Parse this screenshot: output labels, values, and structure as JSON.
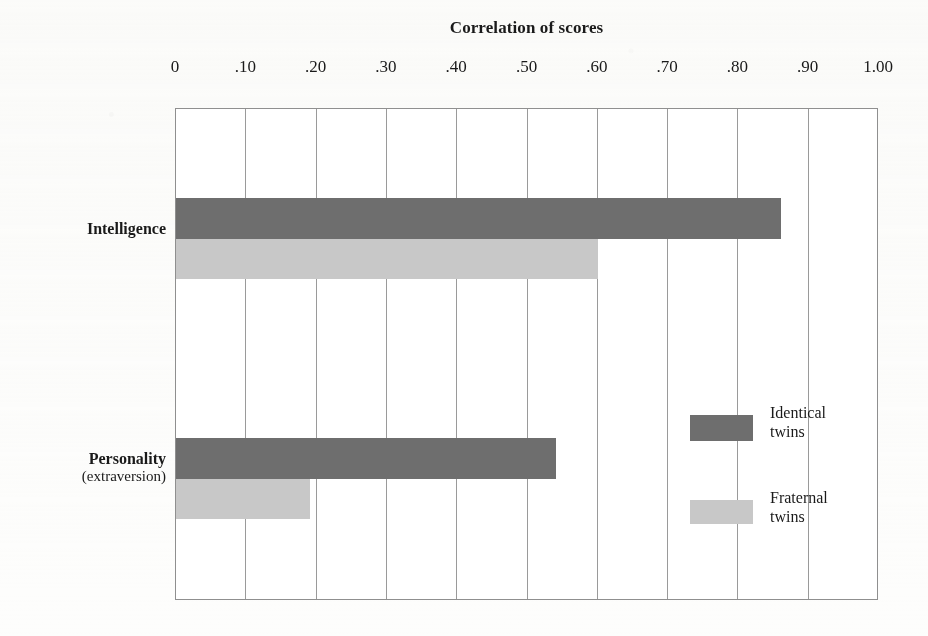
{
  "chart_data": {
    "type": "bar",
    "orientation": "horizontal",
    "title": "Correlation of scores",
    "xlabel": "",
    "ylabel": "",
    "xlim": [
      0,
      1.0
    ],
    "xticks": [
      0,
      0.1,
      0.2,
      0.3,
      0.4,
      0.5,
      0.6,
      0.7,
      0.8,
      0.9,
      1.0
    ],
    "xtick_labels": [
      "0",
      ".10",
      ".20",
      ".30",
      ".40",
      ".50",
      ".60",
      ".70",
      ".80",
      ".90",
      "1.00"
    ],
    "grid": "vertical",
    "legend_position": "inside-right",
    "categories": [
      "Intelligence",
      "Personality (extraversion)"
    ],
    "series": [
      {
        "name": "Identical twins",
        "color": "#6e6e6e",
        "values": [
          0.86,
          0.54
        ]
      },
      {
        "name": "Fraternal twins",
        "color": "#c8c8c8",
        "values": [
          0.6,
          0.19
        ]
      }
    ]
  },
  "axis": {
    "title": "Correlation of scores",
    "tick_labels": [
      "0",
      ".10",
      ".20",
      ".30",
      ".40",
      ".50",
      ".60",
      ".70",
      ".80",
      ".90",
      "1.00"
    ]
  },
  "categories": [
    {
      "main": "Intelligence",
      "sub": ""
    },
    {
      "main": "Personality",
      "sub": "(extraversion)"
    }
  ],
  "legend": [
    {
      "line1": "Identical",
      "line2": "twins",
      "color": "#6e6e6e"
    },
    {
      "line1": "Fraternal",
      "line2": "twins",
      "color": "#c8c8c8"
    }
  ],
  "colors": {
    "identical": "#6e6e6e",
    "fraternal": "#c8c8c8",
    "grid": "#9a9a9a",
    "frame": "#8f8f8f",
    "background": "#fdfdfc",
    "text": "#1a1a1a"
  }
}
